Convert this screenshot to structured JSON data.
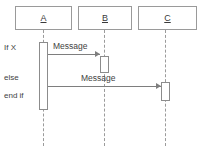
{
  "diagram": {
    "type": "uml-sequence-diagram",
    "colors": {
      "background": "#ffffff",
      "box_border": "#9a9a9a",
      "lifeline": "#9b9b9b",
      "activation_border": "#8c8c8c",
      "message_line": "#7e7e7e",
      "text": "#3f3f3f"
    },
    "participants": [
      {
        "label": "A",
        "underlined": true
      },
      {
        "label": "B",
        "underlined": true
      },
      {
        "label": "C",
        "underlined": true
      }
    ],
    "guards": [
      {
        "label": "If X"
      },
      {
        "label": "else"
      },
      {
        "label": "end if"
      }
    ],
    "messages": [
      {
        "label": "Message",
        "from": "A",
        "to": "B"
      },
      {
        "label": "Message",
        "from": "A",
        "to": "C"
      }
    ]
  }
}
